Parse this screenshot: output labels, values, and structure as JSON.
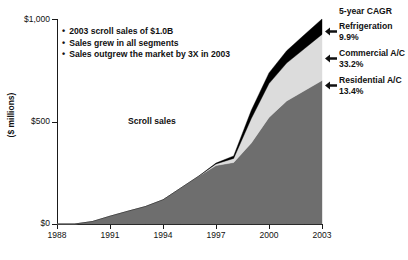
{
  "chart_data": {
    "type": "area",
    "title": "",
    "xlabel": "",
    "ylabel": "($ millions)",
    "ylim": [
      0,
      1000
    ],
    "xlim": [
      1988,
      2003
    ],
    "grid": false,
    "stacked": true,
    "legend_position": "right",
    "legend_title": "5-year CAGR",
    "x": [
      1988,
      1989,
      1990,
      1991,
      1992,
      1993,
      1994,
      1995,
      1996,
      1997,
      1998,
      1999,
      2000,
      2001,
      2002,
      2003
    ],
    "y_ticks": [
      0,
      500,
      1000
    ],
    "y_tick_labels": [
      "$0",
      "$500",
      "$1,000"
    ],
    "x_ticks": [
      1988,
      1991,
      1994,
      1997,
      2000,
      2003
    ],
    "x_tick_labels": [
      "1988",
      "1991",
      "1994",
      "1997",
      "2000",
      "2003"
    ],
    "series": [
      {
        "name": "Residential A/C",
        "color": "#6e6e6e",
        "cagr": "13.4%",
        "values": [
          0,
          0,
          12,
          38,
          62,
          85,
          118,
          175,
          232,
          285,
          300,
          395,
          520,
          600,
          650,
          700
        ]
      },
      {
        "name": "Commercial A/C",
        "color": "#dcdcdc",
        "cagr": "33.2%",
        "values": [
          0,
          0,
          0,
          0,
          0,
          0,
          0,
          0,
          0,
          8,
          20,
          120,
          165,
          185,
          205,
          225
        ]
      },
      {
        "name": "Refrigeration",
        "color": "#000000",
        "cagr": "9.9%",
        "values": [
          0,
          0,
          0,
          0,
          0,
          0,
          0,
          0,
          0,
          4,
          12,
          40,
          52,
          60,
          68,
          75
        ]
      }
    ],
    "totals": [
      0,
      0,
      12,
      38,
      62,
      85,
      118,
      175,
      232,
      297,
      332,
      555,
      737,
      845,
      923,
      1000
    ],
    "annotations": [
      {
        "name": "scroll-sales",
        "text": "Scroll sales",
        "x": 1994.2,
        "y": 560
      }
    ],
    "bullets": [
      "2003 scroll sales of $1.0B",
      "Sales grew in all segments",
      "Sales outgrew the market by 3X in 2003"
    ]
  },
  "axis": {
    "y_title": "($ millions)",
    "y_labels": [
      "$1,000",
      "$500",
      "$0"
    ],
    "x_labels": [
      "1988",
      "1991",
      "1994",
      "1997",
      "2000",
      "2003"
    ]
  },
  "bullets": [
    "2003 scroll sales of $1.0B",
    "Sales grew in all segments",
    "Sales outgrew the market by 3X in 2003"
  ],
  "plot_label": "Scroll sales",
  "legend": {
    "title": "5-year CAGR",
    "items": [
      {
        "label": "Refrigeration",
        "value": "9.9%",
        "icon": "left-arrow-icon",
        "color": "#000000"
      },
      {
        "label": "Commercial A/C",
        "value": "33.2%",
        "icon": "left-arrow-icon",
        "color": "#dcdcdc"
      },
      {
        "label": "Residential A/C",
        "value": "13.4%",
        "icon": "left-arrow-icon",
        "color": "#6e6e6e"
      }
    ]
  },
  "bottom_caption": ""
}
